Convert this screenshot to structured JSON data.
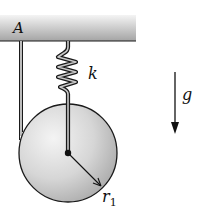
{
  "diagram": {
    "labels": {
      "ceiling_point": "A",
      "spring_constant": "k",
      "gravity": "g",
      "radius": "r",
      "radius_subscript": "1"
    },
    "colors": {
      "ceiling_top": "#f2f2f2",
      "ceiling_bottom": "#a8a8a8",
      "disk_light": "#f0f0f0",
      "disk_dark": "#b4b4b4",
      "stroke": "#1a1a1a"
    },
    "elements": [
      {
        "name": "ceiling",
        "type": "fixed support"
      },
      {
        "name": "string",
        "type": "inextensible cord from A, wrapped around disk"
      },
      {
        "name": "spring",
        "type": "spring attached to disk center",
        "label": "k"
      },
      {
        "name": "disk",
        "type": "uniform disk",
        "label": "r1"
      },
      {
        "name": "gravity-arrow",
        "type": "direction of gravity",
        "label": "g"
      }
    ]
  }
}
